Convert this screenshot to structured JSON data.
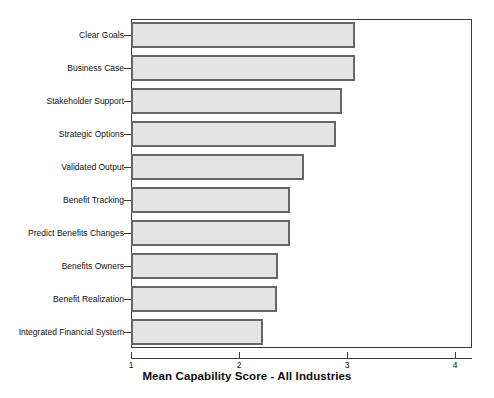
{
  "top_caption": "",
  "chart_data": {
    "type": "bar",
    "orientation": "horizontal",
    "title": "",
    "xlabel": "Mean Capability Score - All Industries",
    "ylabel": "",
    "xlim": [
      1,
      4
    ],
    "xticks": [
      1,
      2,
      3,
      4
    ],
    "xtick_labels": [
      "1",
      "2",
      "3",
      "4"
    ],
    "grid": false,
    "legend": null,
    "categories": [
      "Clear Goals",
      "Business Case",
      "Stakeholder Support",
      "Strategic Options",
      "Validated Output",
      "Benefit Tracking",
      "Predict Benefits Changes",
      "Benefits Owners",
      "Benefit Realization",
      "Integrated Financial System"
    ],
    "values": [
      3.07,
      3.07,
      2.95,
      2.9,
      2.6,
      2.47,
      2.47,
      2.36,
      2.35,
      2.22
    ],
    "bar_fill_color": "#e4e4e4",
    "bar_border_color": "#666666",
    "axis_color": "#3a3a3a",
    "background_color": "#ffffff"
  }
}
